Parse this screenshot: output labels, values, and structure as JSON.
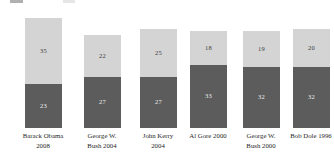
{
  "chart_data": {
    "type": "bar",
    "subtype": "stacked-vertical",
    "title": "",
    "subtitle": "",
    "xlabel": "",
    "ylabel": "",
    "ylim": [
      0,
      60
    ],
    "grid": false,
    "legend_position": "top-cropped",
    "categories": [
      "Barack Obama 2008",
      "George W. Bush 2004",
      "John Kerry 2004",
      "Al Gore 2000",
      "George W. Bush 2000",
      "Bob Dole 1996"
    ],
    "category_lines": [
      [
        "Barack Obama",
        "2008"
      ],
      [
        "George W.",
        "Bush 2004"
      ],
      [
        "John Kerry",
        "2004"
      ],
      [
        "Al Gore 2000",
        ""
      ],
      [
        "George W.",
        "Bush 2000"
      ],
      [
        "Bob Dole 1996",
        ""
      ]
    ],
    "series": [
      {
        "name": "bottom-segment",
        "color": "#5c5c5c",
        "values": [
          23,
          27,
          27,
          33,
          32,
          32
        ]
      },
      {
        "name": "top-segment",
        "color": "#d4d4d4",
        "values": [
          35,
          22,
          25,
          18,
          19,
          20
        ]
      }
    ],
    "totals": [
      58,
      49,
      52,
      51,
      51,
      52
    ],
    "value_labels": {
      "top": [
        "35",
        "22",
        "25",
        "18",
        "19",
        "20"
      ],
      "bottom": [
        "23",
        "27",
        "27",
        "33",
        "32",
        "32"
      ]
    }
  },
  "colors": {
    "background": "#ffffff",
    "segment_top": "#d4d4d4",
    "segment_bottom": "#5c5c5c",
    "label_dark": "#3d3d3d",
    "label_light": "#ededed",
    "category_text": "#1f1f1f"
  },
  "legend_remnants": [
    {
      "name": "dark-swatch",
      "color": "#6f6f6f"
    },
    {
      "name": "light-swatch",
      "color": "#d2d2d2"
    }
  ]
}
